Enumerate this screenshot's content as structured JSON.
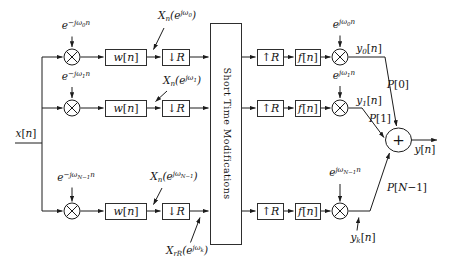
{
  "colors": {
    "ink": "#1c1c1c",
    "background": "#ffffff"
  },
  "figure": {
    "input_label": [
      [
        "x"
      ],
      [
        "[",
        "n"
      ],
      [
        "n"
      ],
      [
        "]",
        "n"
      ]
    ],
    "analysis": {
      "branches": [
        {
          "carrier": [
            [
              "e"
            ],
            [
              "−jω",
              "sup"
            ],
            [
              "0",
              "supsub"
            ],
            [
              "n",
              "sup"
            ]
          ],
          "window": [
            [
              "w"
            ],
            [
              "[",
              "n"
            ],
            [
              "n"
            ],
            [
              "]",
              "n"
            ]
          ],
          "decimator": [
            [
              "↓",
              "n"
            ],
            [
              "R"
            ]
          ],
          "stft_label": [
            [
              "X"
            ],
            [
              "n",
              "sub"
            ],
            [
              "(e"
            ],
            [
              "jω",
              "sup"
            ],
            [
              "0",
              "supsub"
            ],
            [
              ")"
            ]
          ]
        },
        {
          "carrier": [
            [
              "e"
            ],
            [
              "−jω",
              "sup"
            ],
            [
              "1",
              "supsub"
            ],
            [
              "n",
              "sup"
            ]
          ],
          "window": [
            [
              "w"
            ],
            [
              "[",
              "n"
            ],
            [
              "n"
            ],
            [
              "]",
              "n"
            ]
          ],
          "decimator": [
            [
              "↓",
              "n"
            ],
            [
              "R"
            ]
          ],
          "stft_label": [
            [
              "X"
            ],
            [
              "n",
              "sub"
            ],
            [
              "(e"
            ],
            [
              "jω",
              "sup"
            ],
            [
              "1",
              "supsub"
            ],
            [
              ")"
            ]
          ]
        },
        {
          "carrier": [
            [
              "e"
            ],
            [
              "−jω",
              "sup"
            ],
            [
              "N−1",
              "supsub"
            ],
            [
              "n",
              "sup"
            ]
          ],
          "window": [
            [
              "w"
            ],
            [
              "[",
              "n"
            ],
            [
              "n"
            ],
            [
              "]",
              "n"
            ]
          ],
          "decimator": [
            [
              "↓",
              "n"
            ],
            [
              "R"
            ]
          ],
          "stft_label": [
            [
              "X"
            ],
            [
              "n",
              "sub"
            ],
            [
              "(e"
            ],
            [
              "jω",
              "sup"
            ],
            [
              "N−1",
              "supsub"
            ],
            [
              ")"
            ]
          ]
        }
      ],
      "decimated_stft_label": [
        [
          "X"
        ],
        [
          "rR",
          "sub"
        ],
        [
          "(e"
        ],
        [
          "jω",
          "sup"
        ],
        [
          "k",
          "supsub"
        ],
        [
          ")"
        ]
      ]
    },
    "stm_block": "Short Time Modifications",
    "synthesis": {
      "branches": [
        {
          "interpolator": [
            [
              "↑",
              "n"
            ],
            [
              "R"
            ]
          ],
          "filter": [
            [
              "f"
            ],
            [
              "[",
              "n"
            ],
            [
              "n"
            ],
            [
              "]",
              "n"
            ]
          ],
          "carrier": [
            [
              "e"
            ],
            [
              "jω",
              "sup"
            ],
            [
              "0",
              "supsub"
            ],
            [
              "n",
              "sup"
            ]
          ],
          "signal_label": [
            [
              "y"
            ],
            [
              "0",
              "sub"
            ],
            [
              "[",
              "n"
            ],
            [
              "n"
            ],
            [
              "]",
              "n"
            ]
          ],
          "gain_label": [
            [
              "P"
            ],
            [
              "[0]",
              "n"
            ]
          ]
        },
        {
          "interpolator": [
            [
              "↑",
              "n"
            ],
            [
              "R"
            ]
          ],
          "filter": [
            [
              "f"
            ],
            [
              "[",
              "n"
            ],
            [
              "n"
            ],
            [
              "]",
              "n"
            ]
          ],
          "carrier": [
            [
              "e"
            ],
            [
              "jω",
              "sup"
            ],
            [
              "1",
              "supsub"
            ],
            [
              "n",
              "sup"
            ]
          ],
          "signal_label": [
            [
              "y"
            ],
            [
              "1",
              "sub"
            ],
            [
              "[",
              "n"
            ],
            [
              "n"
            ],
            [
              "]",
              "n"
            ]
          ],
          "gain_label": [
            [
              "P"
            ],
            [
              "[1]",
              "n"
            ]
          ]
        },
        {
          "interpolator": [
            [
              "↑",
              "n"
            ],
            [
              "R"
            ]
          ],
          "filter": [
            [
              "f"
            ],
            [
              "[",
              "n"
            ],
            [
              "n"
            ],
            [
              "]",
              "n"
            ]
          ],
          "carrier": [
            [
              "e"
            ],
            [
              "jω",
              "sup"
            ],
            [
              "N−1",
              "supsub"
            ],
            [
              "n",
              "sup"
            ]
          ],
          "signal_label": [
            [
              "y"
            ],
            [
              "k",
              "sub"
            ],
            [
              "[",
              "n"
            ],
            [
              "n"
            ],
            [
              "]",
              "n"
            ]
          ],
          "gain_label": [
            [
              "P"
            ],
            [
              "[",
              "n"
            ],
            [
              "N"
            ],
            [
              "−1]",
              "n"
            ]
          ]
        }
      ],
      "adder_symbol": "+",
      "output_label": [
        [
          "y"
        ],
        [
          "[",
          "n"
        ],
        [
          "n"
        ],
        [
          "]",
          "n"
        ]
      ]
    }
  }
}
